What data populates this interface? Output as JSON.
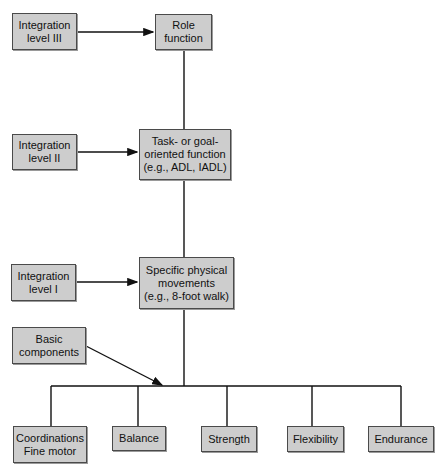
{
  "diagram": {
    "levels": [
      {
        "id": "integration-3",
        "label": "Integration\nlevel III",
        "target": "Role\nfunction"
      },
      {
        "id": "integration-2",
        "label": "Integration\nlevel II",
        "target": "Task- or goal-\noriented function\n(e.g., ADL, IADL)"
      },
      {
        "id": "integration-1",
        "label": "Integration\nlevel I",
        "target": "Specific physical\nmovements\n(e.g., 8-foot walk)"
      }
    ],
    "basic": {
      "label": "Basic\ncomponents"
    },
    "components": [
      {
        "label": "Coordinations\nFine motor"
      },
      {
        "label": "Balance"
      },
      {
        "label": "Strength"
      },
      {
        "label": "Flexibility"
      },
      {
        "label": "Endurance"
      }
    ]
  },
  "colors": {
    "box_fill": "#cdcdcd",
    "box_border": "#4a4a4a",
    "line": "#111111"
  }
}
